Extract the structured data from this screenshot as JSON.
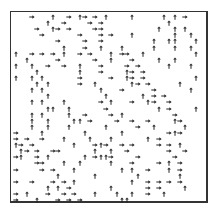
{
  "figure": {
    "frame": {
      "left": 10,
      "top": 11,
      "width": 198,
      "height": 192
    },
    "grid": {
      "cols": 32,
      "rows": 31,
      "cell_w": 6.15,
      "cell_h": 6.1,
      "offset_x": 13,
      "offset_y": 14
    },
    "arrow_color": "#222222",
    "arrows": [
      [
        3,
        0,
        "r"
      ],
      [
        7,
        0,
        "u"
      ],
      [
        10,
        0,
        "r"
      ],
      [
        12,
        0,
        "u"
      ],
      [
        13,
        0,
        "r"
      ],
      [
        15,
        0,
        "r"
      ],
      [
        17,
        0,
        "u"
      ],
      [
        22,
        0,
        "u"
      ],
      [
        28,
        0,
        "u"
      ],
      [
        30,
        0,
        "u"
      ],
      [
        32,
        0,
        "r"
      ],
      [
        6,
        1,
        "u"
      ],
      [
        9,
        1,
        "r"
      ],
      [
        14,
        1,
        "r"
      ],
      [
        16,
        1,
        "r"
      ],
      [
        29,
        1,
        "u"
      ],
      [
        4,
        2,
        "r"
      ],
      [
        7,
        2,
        "u"
      ],
      [
        8,
        2,
        "r"
      ],
      [
        10,
        2,
        "r"
      ],
      [
        15,
        2,
        "r"
      ],
      [
        16,
        2,
        "r"
      ],
      [
        27,
        2,
        "u"
      ],
      [
        30,
        2,
        "u"
      ],
      [
        32,
        2,
        "u"
      ],
      [
        5,
        3,
        "r"
      ],
      [
        12,
        3,
        "r"
      ],
      [
        16,
        3,
        "r"
      ],
      [
        18,
        3,
        "r"
      ],
      [
        22,
        3,
        "u"
      ],
      [
        30,
        3,
        "u"
      ],
      [
        33,
        3,
        "u"
      ],
      [
        8,
        4,
        "r"
      ],
      [
        13,
        4,
        "r"
      ],
      [
        16,
        4,
        "r"
      ],
      [
        26,
        4,
        "u"
      ],
      [
        29,
        4,
        "u"
      ],
      [
        30,
        4,
        "u"
      ],
      [
        34,
        4,
        "u"
      ],
      [
        9,
        5,
        "u"
      ],
      [
        13,
        5,
        "r"
      ],
      [
        16,
        5,
        "u"
      ],
      [
        20,
        5,
        "u"
      ],
      [
        26,
        5,
        "u"
      ],
      [
        30,
        5,
        "u"
      ],
      [
        33,
        5,
        "u"
      ],
      [
        0,
        6,
        "u"
      ],
      [
        3,
        6,
        "r"
      ],
      [
        5,
        6,
        "r"
      ],
      [
        7,
        6,
        "r"
      ],
      [
        9,
        6,
        "u"
      ],
      [
        12,
        6,
        "r"
      ],
      [
        14,
        6,
        "r"
      ],
      [
        18,
        6,
        "u"
      ],
      [
        20,
        6,
        "r"
      ],
      [
        21,
        6,
        "r"
      ],
      [
        24,
        6,
        "u"
      ],
      [
        34,
        6,
        "u"
      ],
      [
        2,
        7,
        "u"
      ],
      [
        8,
        7,
        "r"
      ],
      [
        15,
        7,
        "r"
      ],
      [
        18,
        7,
        "u"
      ],
      [
        22,
        7,
        "r"
      ],
      [
        27,
        7,
        "u"
      ],
      [
        30,
        7,
        "u"
      ],
      [
        0,
        8,
        "u"
      ],
      [
        3,
        8,
        "u"
      ],
      [
        6,
        8,
        "r"
      ],
      [
        9,
        8,
        "r"
      ],
      [
        12,
        8,
        "u"
      ],
      [
        16,
        8,
        "r"
      ],
      [
        21,
        8,
        "r"
      ],
      [
        23,
        8,
        "r"
      ],
      [
        29,
        8,
        "u"
      ],
      [
        33,
        8,
        "u"
      ],
      [
        4,
        9,
        "u"
      ],
      [
        12,
        9,
        "u"
      ],
      [
        16,
        9,
        "r"
      ],
      [
        21,
        9,
        "u"
      ],
      [
        22,
        9,
        "r"
      ],
      [
        24,
        9,
        "r"
      ],
      [
        0,
        10,
        "u"
      ],
      [
        3,
        10,
        "u"
      ],
      [
        5,
        10,
        "u"
      ],
      [
        12,
        10,
        "r"
      ],
      [
        18,
        10,
        "r"
      ],
      [
        21,
        10,
        "u"
      ],
      [
        22,
        10,
        "r"
      ],
      [
        24,
        10,
        "r"
      ],
      [
        34,
        10,
        "u"
      ],
      [
        4,
        11,
        "u"
      ],
      [
        6,
        11,
        "u"
      ],
      [
        12,
        11,
        "r"
      ],
      [
        15,
        11,
        "u"
      ],
      [
        22,
        11,
        "u"
      ],
      [
        23,
        11,
        "r"
      ],
      [
        25,
        11,
        "r"
      ],
      [
        31,
        11,
        "u"
      ],
      [
        3,
        12,
        "u"
      ],
      [
        5,
        12,
        "u"
      ],
      [
        16,
        12,
        "u"
      ],
      [
        20,
        12,
        "r"
      ],
      [
        26,
        12,
        "r"
      ],
      [
        33,
        12,
        "u"
      ],
      [
        6,
        13,
        "u"
      ],
      [
        17,
        13,
        "u"
      ],
      [
        24,
        13,
        "u"
      ],
      [
        26,
        13,
        "r"
      ],
      [
        28,
        13,
        "r"
      ],
      [
        3,
        14,
        "u"
      ],
      [
        5,
        14,
        "u"
      ],
      [
        9,
        14,
        "u"
      ],
      [
        16,
        14,
        "r"
      ],
      [
        18,
        14,
        "u"
      ],
      [
        22,
        14,
        "r"
      ],
      [
        25,
        14,
        "u"
      ],
      [
        26,
        14,
        "r"
      ],
      [
        29,
        14,
        "r"
      ],
      [
        6,
        15,
        "u"
      ],
      [
        7,
        15,
        "u"
      ],
      [
        10,
        15,
        "u"
      ],
      [
        17,
        15,
        "r"
      ],
      [
        27,
        15,
        "u"
      ],
      [
        29,
        15,
        "r"
      ],
      [
        34,
        15,
        "u"
      ],
      [
        3,
        16,
        "u"
      ],
      [
        5,
        16,
        "u"
      ],
      [
        10,
        16,
        "u"
      ],
      [
        13,
        16,
        "r"
      ],
      [
        18,
        16,
        "r"
      ],
      [
        20,
        16,
        "u"
      ],
      [
        30,
        16,
        "r"
      ],
      [
        3,
        17,
        "u"
      ],
      [
        6,
        17,
        "u"
      ],
      [
        11,
        17,
        "u"
      ],
      [
        12,
        17,
        "u"
      ],
      [
        14,
        17,
        "r"
      ],
      [
        19,
        17,
        "r"
      ],
      [
        22,
        17,
        "r"
      ],
      [
        25,
        17,
        "r"
      ],
      [
        30,
        17,
        "u"
      ],
      [
        31,
        17,
        "r"
      ],
      [
        3,
        18,
        "u"
      ],
      [
        6,
        18,
        "u"
      ],
      [
        10,
        18,
        "u"
      ],
      [
        17,
        18,
        "u"
      ],
      [
        23,
        18,
        "r"
      ],
      [
        26,
        18,
        "u"
      ],
      [
        32,
        18,
        "u"
      ],
      [
        0,
        19,
        "r"
      ],
      [
        5,
        19,
        "u"
      ],
      [
        13,
        19,
        "u"
      ],
      [
        20,
        19,
        "u"
      ],
      [
        29,
        19,
        "r"
      ],
      [
        30,
        19,
        "u"
      ],
      [
        31,
        19,
        "r"
      ],
      [
        0,
        20,
        "r"
      ],
      [
        2,
        20,
        "r"
      ],
      [
        5,
        20,
        "r"
      ],
      [
        9,
        20,
        "u"
      ],
      [
        14,
        20,
        "u"
      ],
      [
        18,
        20,
        "u"
      ],
      [
        25,
        20,
        "u"
      ],
      [
        27,
        20,
        "r"
      ],
      [
        0,
        21,
        "u"
      ],
      [
        1,
        21,
        "r"
      ],
      [
        3,
        21,
        "r"
      ],
      [
        11,
        21,
        "u"
      ],
      [
        15,
        21,
        "r"
      ],
      [
        16,
        21,
        "u"
      ],
      [
        17,
        21,
        "r"
      ],
      [
        20,
        21,
        "r"
      ],
      [
        22,
        21,
        "r"
      ],
      [
        27,
        21,
        "r"
      ],
      [
        29,
        21,
        "r"
      ],
      [
        31,
        21,
        "u"
      ],
      [
        1,
        22,
        "u"
      ],
      [
        2,
        22,
        "r"
      ],
      [
        4,
        22,
        "r"
      ],
      [
        7,
        22,
        "r"
      ],
      [
        8,
        22,
        "r"
      ],
      [
        15,
        22,
        "u"
      ],
      [
        18,
        22,
        "u"
      ],
      [
        21,
        22,
        "r"
      ],
      [
        29,
        22,
        "r"
      ],
      [
        32,
        22,
        "r"
      ],
      [
        0,
        23,
        "r"
      ],
      [
        1,
        23,
        "u"
      ],
      [
        4,
        23,
        "r"
      ],
      [
        6,
        23,
        "u"
      ],
      [
        13,
        23,
        "u"
      ],
      [
        15,
        23,
        "r"
      ],
      [
        16,
        23,
        "u"
      ],
      [
        17,
        23,
        "u"
      ],
      [
        18,
        23,
        "r"
      ],
      [
        23,
        23,
        "r"
      ],
      [
        30,
        23,
        "r"
      ],
      [
        4,
        24,
        "r"
      ],
      [
        5,
        24,
        "r"
      ],
      [
        9,
        24,
        "u"
      ],
      [
        12,
        24,
        "u"
      ],
      [
        18,
        24,
        "u"
      ],
      [
        22,
        24,
        "r"
      ],
      [
        27,
        24,
        "r"
      ],
      [
        29,
        24,
        "u"
      ],
      [
        31,
        24,
        "r"
      ],
      [
        0,
        25,
        "r"
      ],
      [
        5,
        25,
        "r"
      ],
      [
        7,
        25,
        "r"
      ],
      [
        11,
        25,
        "u"
      ],
      [
        20,
        25,
        "u"
      ],
      [
        22,
        25,
        "u"
      ],
      [
        25,
        25,
        "r"
      ],
      [
        29,
        25,
        "u"
      ],
      [
        31,
        25,
        "r"
      ],
      [
        8,
        26,
        "u"
      ],
      [
        15,
        26,
        "u"
      ],
      [
        23,
        26,
        "u"
      ],
      [
        31,
        26,
        "u"
      ],
      [
        0,
        27,
        "r"
      ],
      [
        3,
        27,
        "r"
      ],
      [
        7,
        27,
        "r"
      ],
      [
        9,
        27,
        "r"
      ],
      [
        11,
        27,
        "u"
      ],
      [
        22,
        27,
        "u"
      ],
      [
        25,
        27,
        "r"
      ],
      [
        27,
        27,
        "r"
      ],
      [
        29,
        27,
        "r"
      ],
      [
        31,
        27,
        "r"
      ],
      [
        6,
        28,
        "u"
      ],
      [
        8,
        28,
        "u"
      ],
      [
        10,
        28,
        "r"
      ],
      [
        18,
        28,
        "u"
      ],
      [
        25,
        28,
        "r"
      ],
      [
        27,
        28,
        "r"
      ],
      [
        32,
        28,
        "u"
      ],
      [
        0,
        29,
        "r"
      ],
      [
        2,
        29,
        "u"
      ],
      [
        6,
        29,
        "r"
      ],
      [
        9,
        29,
        "r"
      ],
      [
        11,
        29,
        "r"
      ],
      [
        15,
        29,
        "u"
      ],
      [
        19,
        29,
        "u"
      ],
      [
        22,
        29,
        "u"
      ],
      [
        25,
        29,
        "r"
      ],
      [
        28,
        29,
        "u"
      ],
      [
        0,
        30,
        "r"
      ],
      [
        4,
        30,
        "u"
      ],
      [
        8,
        30,
        "r"
      ],
      [
        10,
        30,
        "r"
      ],
      [
        12,
        30,
        "r"
      ],
      [
        20,
        30,
        "u"
      ],
      [
        21,
        30,
        "u"
      ]
    ]
  }
}
